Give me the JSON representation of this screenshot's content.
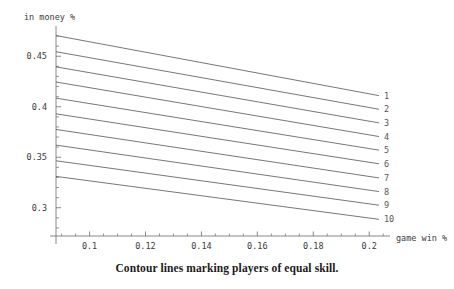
{
  "figure": {
    "caption": "Contour lines marking players of equal skill.",
    "background_color": "#ffffff",
    "line_color": "#4a4a4a",
    "axis_color": "#6b6b6b",
    "text_color": "#3a3a3a"
  },
  "chart_data": {
    "type": "line",
    "title": "",
    "subtitle": "",
    "xlabel": "game win %",
    "ylabel": "in money %",
    "grid": false,
    "legend_position": "right-endpoints",
    "xlim": [
      0.088,
      0.206
    ],
    "ylim": [
      0.272,
      0.476
    ],
    "x_ticks": [
      0.1,
      0.12,
      0.14,
      0.16,
      0.18,
      0.2
    ],
    "x_tick_labels": [
      "0.1",
      "0.12",
      "0.14",
      "0.16",
      "0.18",
      "0.2"
    ],
    "x_minor_tick_step": 0.005,
    "y_ticks": [
      0.3,
      0.35,
      0.4,
      0.45
    ],
    "y_tick_labels": [
      "0.3",
      "0.35",
      "0.4",
      "0.45"
    ],
    "y_minor_tick_step": 0.01,
    "annotations": [
      "1",
      "2",
      "3",
      "4",
      "5",
      "6",
      "7",
      "8",
      "9",
      "10"
    ],
    "series": [
      {
        "name": "1",
        "x": [
          0.088,
          0.2035
        ],
        "values": [
          0.4705,
          0.411
        ]
      },
      {
        "name": "2",
        "x": [
          0.088,
          0.2035
        ],
        "values": [
          0.4545,
          0.3975
        ]
      },
      {
        "name": "3",
        "x": [
          0.088,
          0.2035
        ],
        "values": [
          0.4395,
          0.384
        ]
      },
      {
        "name": "4",
        "x": [
          0.088,
          0.2035
        ],
        "values": [
          0.4245,
          0.3705
        ]
      },
      {
        "name": "5",
        "x": [
          0.088,
          0.2035
        ],
        "values": [
          0.4085,
          0.357
        ]
      },
      {
        "name": "6",
        "x": [
          0.088,
          0.2035
        ],
        "values": [
          0.393,
          0.3435
        ]
      },
      {
        "name": "7",
        "x": [
          0.088,
          0.2035
        ],
        "values": [
          0.3775,
          0.3295
        ]
      },
      {
        "name": "8",
        "x": [
          0.088,
          0.2035
        ],
        "values": [
          0.362,
          0.316
        ]
      },
      {
        "name": "9",
        "x": [
          0.088,
          0.2035
        ],
        "values": [
          0.3465,
          0.3025
        ]
      },
      {
        "name": "10",
        "x": [
          0.088,
          0.2035
        ],
        "values": [
          0.331,
          0.2885
        ]
      }
    ]
  }
}
